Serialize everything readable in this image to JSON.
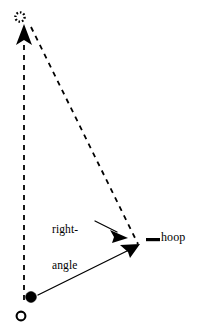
{
  "figure": {
    "type": "geometric-diagram",
    "background_color": "#ffffff",
    "stroke_color": "#000000",
    "labels": {
      "right_angle_line1": "right-",
      "right_angle_line2": "angle",
      "hoop": "hoop"
    },
    "markers": [
      {
        "name": "dotted-circle-marker",
        "shape": "dotted-circle-outline",
        "cx": 20,
        "cy": 17,
        "r": 5.5,
        "fill": "none",
        "stroke": "#000000"
      },
      {
        "name": "filled-dot-marker",
        "shape": "filled-circle",
        "cx": 31,
        "cy": 297,
        "r": 5.5,
        "fill": "#000000",
        "stroke": "#000000"
      },
      {
        "name": "hollow-circle-marker",
        "shape": "hollow-circle",
        "cx": 21,
        "cy": 316,
        "r": 5.0,
        "fill": "#ffffff",
        "stroke": "#000000"
      },
      {
        "name": "hoop-bar-marker",
        "shape": "horizontal-bar",
        "x": 146,
        "y": 238,
        "width": 14,
        "height": 3,
        "fill": "#000000"
      }
    ],
    "vectors": [
      {
        "name": "vertical-dashed-vector",
        "style": "dashed",
        "x1": 24,
        "y1": 300,
        "x2": 24,
        "y2": 38,
        "arrowhead": "up",
        "arrow_x": 24,
        "arrow_y": 28
      },
      {
        "name": "diagonal-dashed-vector",
        "style": "dashed",
        "x1": 30,
        "y1": 26,
        "x2": 137,
        "y2": 243,
        "arrowhead": "none"
      },
      {
        "name": "solid-resultant-vector",
        "style": "solid",
        "x1": 37,
        "y1": 295,
        "x2": 130,
        "y2": 249,
        "arrowhead": "right-down",
        "arrow_x": 137,
        "arrow_y": 246
      },
      {
        "name": "right-angle-pointer-arrow",
        "style": "solid",
        "x1": 94,
        "y1": 221,
        "x2": 115,
        "y2": 232,
        "arrowhead": "right-down",
        "arrow_x": 124,
        "arrow_y": 236
      }
    ]
  }
}
